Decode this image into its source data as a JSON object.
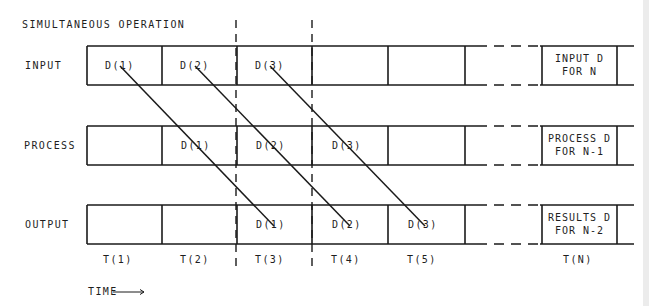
{
  "title": "SIMULTANEOUS OPERATION",
  "rows": [
    {
      "label": "INPUT",
      "cells": [
        "D(1)",
        "D(2)",
        "D(3)",
        "",
        ""
      ],
      "last_cell": [
        "INPUT D",
        "FOR N"
      ]
    },
    {
      "label": "PROCESS",
      "cells": [
        "",
        "D(1)",
        "D(2)",
        "D(3)",
        ""
      ],
      "last_cell": [
        "PROCESS D",
        "FOR N-1"
      ]
    },
    {
      "label": "OUTPUT",
      "cells": [
        "",
        "",
        "D(1)",
        "D(2)",
        "D(3)"
      ],
      "last_cell": [
        "RESULTS D",
        "FOR N-2"
      ]
    }
  ],
  "time_labels": [
    "T(1)",
    "T(2)",
    "T(3)",
    "T(4)",
    "T(5)",
    "T(N)"
  ],
  "time_axis_label": "TIME",
  "arrow_icon": "right-arrow",
  "colors": {
    "line": "#1a1a1a",
    "background": "#ffffff"
  }
}
